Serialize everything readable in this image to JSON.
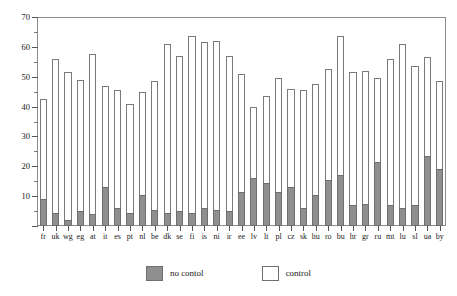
{
  "chart_data": {
    "type": "bar",
    "title": "",
    "subtitle": "",
    "xlabel": "",
    "ylabel": "",
    "ylim": [
      0,
      70
    ],
    "yticks": [
      0,
      10,
      20,
      30,
      40,
      50,
      60,
      70
    ],
    "ytick_labels": [
      "",
      "10",
      "20",
      "30",
      "40",
      "50",
      "60",
      "70"
    ],
    "yminor_step": 5,
    "grid": false,
    "stacked": true,
    "legend_position": "bottom-center",
    "categories": [
      "fr",
      "uk",
      "wg",
      "eg",
      "at",
      "it",
      "es",
      "pt",
      "nl",
      "be",
      "dk",
      "se",
      "fi",
      "is",
      "ni",
      "ir",
      "ee",
      "lv",
      "lt",
      "pl",
      "cz",
      "sk",
      "hu",
      "ro",
      "bu",
      "hr",
      "gr",
      "ru",
      "mt",
      "lu",
      "sl",
      "ua",
      "by"
    ],
    "series": [
      {
        "name": "no contol",
        "color": "#8f8f8f",
        "values": [
          9.0,
          4.5,
          2.0,
          5.0,
          4.0,
          13.0,
          6.0,
          4.5,
          10.5,
          5.5,
          4.5,
          5.0,
          4.5,
          6.0,
          5.5,
          5.0,
          11.5,
          16.0,
          14.5,
          11.5,
          13.0,
          6.0,
          10.5,
          15.5,
          17.0,
          7.0,
          7.5,
          21.5,
          7.0,
          6.0,
          7.0,
          23.5,
          19.0
        ]
      },
      {
        "name": "control",
        "color": "#ffffff",
        "values": [
          42.5,
          56.0,
          51.5,
          49.0,
          57.5,
          47.0,
          45.5,
          41.0,
          45.0,
          48.5,
          61.0,
          57.0,
          63.5,
          61.5,
          62.0,
          57.0,
          51.0,
          40.0,
          43.5,
          49.5,
          46.0,
          45.5,
          47.5,
          52.5,
          63.5,
          51.5,
          52.0,
          49.5,
          56.0,
          61.0,
          53.5,
          56.5,
          48.5
        ]
      }
    ],
    "annotations": []
  },
  "legend": {
    "entries": [
      {
        "label": "no contol",
        "swatch": "filled-square"
      },
      {
        "label": "control",
        "swatch": "empty-square"
      }
    ]
  }
}
